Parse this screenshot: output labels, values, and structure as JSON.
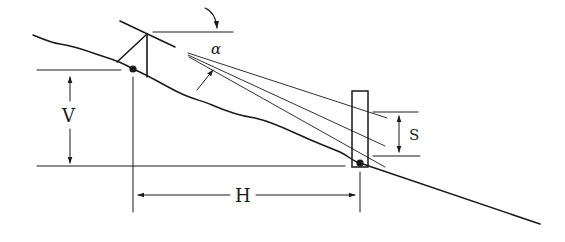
{
  "diagram": {
    "labels": {
      "angle": "α",
      "vertical": "V",
      "horizontal": "H",
      "stadia_interval": "S"
    },
    "colors": {
      "ink": "#1a1a1a",
      "background": "#ffffff"
    },
    "elements": [
      "ground-profile",
      "instrument-tripod",
      "telescope",
      "horizontal-reference-line",
      "vertical-angle-arrow",
      "sight-lines",
      "stadia-rod",
      "stadia-interval-dimension",
      "vertical-distance-dimension",
      "horizontal-distance-dimension"
    ]
  }
}
